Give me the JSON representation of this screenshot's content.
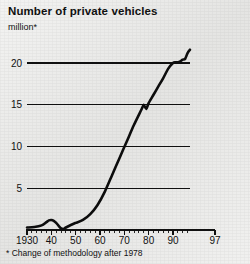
{
  "chart_data": {
    "type": "line",
    "title": "Number of private vehicles",
    "subtitle": "million*",
    "unit": "million",
    "xlabel": "",
    "ylabel": "",
    "footnote": "* Change of methodology after 1978",
    "grid": true,
    "legend": "none",
    "xlim": [
      1930,
      1997
    ],
    "ylim": [
      0,
      23
    ],
    "x_tick_labels": [
      "1930",
      "40",
      "50",
      "60",
      "70",
      "80",
      "90",
      "97"
    ],
    "x_tick_values": [
      1930,
      1940,
      1950,
      1960,
      1970,
      1980,
      1990,
      1997
    ],
    "y_tick_labels": [
      "5",
      "10",
      "15",
      "20"
    ],
    "y_tick_values": [
      5,
      10,
      15,
      20
    ],
    "series": [
      {
        "name": "Private vehicles",
        "color": "#0d0d0d",
        "x": [
          1930,
          1933,
          1936,
          1938,
          1939,
          1940,
          1941,
          1942,
          1943,
          1944,
          1945,
          1946,
          1948,
          1950,
          1953,
          1956,
          1959,
          1962,
          1965,
          1968,
          1971,
          1974,
          1977,
          1978,
          1979,
          1980,
          1982,
          1984,
          1986,
          1988,
          1990,
          1991,
          1992,
          1993,
          1994,
          1995,
          1996,
          1997
        ],
        "values": [
          0.3,
          0.35,
          0.55,
          0.95,
          1.15,
          1.2,
          1.1,
          0.85,
          0.5,
          0.2,
          0.12,
          0.3,
          0.6,
          0.85,
          1.2,
          1.9,
          3.0,
          4.6,
          6.6,
          8.6,
          10.6,
          12.6,
          14.4,
          15.0,
          14.5,
          15.2,
          16.2,
          17.2,
          18.2,
          19.3,
          20.0,
          20.1,
          20.1,
          20.2,
          20.4,
          20.5,
          21.2,
          21.6
        ]
      }
    ],
    "annotations": [
      {
        "text": "Change of methodology after 1978",
        "marker": "*"
      }
    ]
  },
  "layout": {
    "plot_left": 27,
    "plot_right": 190,
    "plot_top": 38,
    "plot_bottom": 230,
    "axis_right": 215
  }
}
